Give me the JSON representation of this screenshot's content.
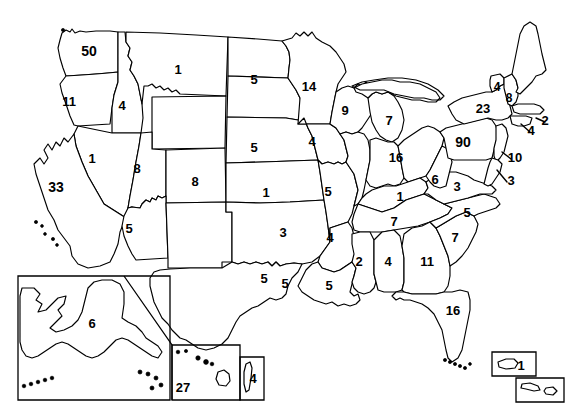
{
  "map": {
    "title": "United States electoral / count map",
    "background_color": "#ffffff",
    "outline_color": "#000000",
    "label_color": "#000000"
  },
  "chart_data": {
    "type": "map",
    "value_label": "count",
    "regions": [
      {
        "code": "WA",
        "name": "Washington",
        "value": "50",
        "x": 89,
        "y": 51,
        "size": "lg"
      },
      {
        "code": "OR",
        "name": "Oregon",
        "value": "11",
        "x": 69,
        "y": 101,
        "size": "md"
      },
      {
        "code": "ID",
        "name": "Idaho",
        "value": "4",
        "x": 122,
        "y": 105,
        "size": "md"
      },
      {
        "code": "MT",
        "name": "Montana",
        "value": "1",
        "x": 178,
        "y": 69,
        "size": "md"
      },
      {
        "code": "ND",
        "name": "North Dakota",
        "value": "5",
        "x": 254,
        "y": 79,
        "size": "md"
      },
      {
        "code": "SD",
        "name": "South Dakota",
        "value": "5",
        "x": 254,
        "y": 147,
        "size": "md"
      },
      {
        "code": "WY",
        "name": "Wyoming",
        "value": "",
        "x": 188,
        "y": 128,
        "size": "md"
      },
      {
        "code": "NV",
        "name": "Nevada",
        "value": "1",
        "x": 92,
        "y": 158,
        "size": "md"
      },
      {
        "code": "UT",
        "name": "Utah",
        "value": "8",
        "x": 137,
        "y": 168,
        "size": "md"
      },
      {
        "code": "CO",
        "name": "Colorado",
        "value": "8",
        "x": 195,
        "y": 181,
        "size": "md"
      },
      {
        "code": "CA",
        "name": "California",
        "value": "33",
        "x": 56,
        "y": 187,
        "size": "lg"
      },
      {
        "code": "AZ",
        "name": "Arizona",
        "value": "5",
        "x": 129,
        "y": 228,
        "size": "md"
      },
      {
        "code": "NM",
        "name": "New Mexico",
        "value": "",
        "x": 190,
        "y": 236,
        "size": "md"
      },
      {
        "code": "NE",
        "name": "Nebraska",
        "value": "1",
        "x": 266,
        "y": 192,
        "size": "md"
      },
      {
        "code": "KS",
        "name": "Kansas",
        "value": "3",
        "x": 283,
        "y": 232,
        "size": "md"
      },
      {
        "code": "OK",
        "name": "Oklahoma",
        "value": "5",
        "x": 285,
        "y": 283,
        "size": "md"
      },
      {
        "code": "TX",
        "name": "Texas",
        "value": "5",
        "x": 264,
        "y": 278,
        "size": "md"
      },
      {
        "code": "MN",
        "name": "Minnesota",
        "value": "14",
        "x": 309,
        "y": 86,
        "size": "md"
      },
      {
        "code": "IA",
        "name": "Iowa",
        "value": "4",
        "x": 312,
        "y": 141,
        "size": "md"
      },
      {
        "code": "MO",
        "name": "Missouri",
        "value": "5",
        "x": 328,
        "y": 191,
        "size": "md"
      },
      {
        "code": "AR",
        "name": "Arkansas",
        "value": "4",
        "x": 330,
        "y": 237,
        "size": "md"
      },
      {
        "code": "LA",
        "name": "Louisiana",
        "value": "5",
        "x": 329,
        "y": 285,
        "size": "md"
      },
      {
        "code": "WI",
        "name": "Wisconsin",
        "value": "9",
        "x": 345,
        "y": 110,
        "size": "md"
      },
      {
        "code": "MI",
        "name": "Michigan",
        "value": "7",
        "x": 389,
        "y": 120,
        "size": "md"
      },
      {
        "code": "IL",
        "name": "Illinois",
        "value": "",
        "x": 358,
        "y": 170,
        "size": "md"
      },
      {
        "code": "IN",
        "name": "Indiana",
        "value": "16",
        "x": 396,
        "y": 157,
        "size": "md"
      },
      {
        "code": "OH",
        "name": "Ohio",
        "value": "",
        "x": 425,
        "y": 148,
        "size": "md"
      },
      {
        "code": "KY",
        "name": "Kentucky",
        "value": "1",
        "x": 400,
        "y": 196,
        "size": "md"
      },
      {
        "code": "TN",
        "name": "Tennessee",
        "value": "7",
        "x": 394,
        "y": 221,
        "size": "md"
      },
      {
        "code": "MS",
        "name": "Mississippi",
        "value": "2",
        "x": 359,
        "y": 261,
        "size": "md"
      },
      {
        "code": "AL",
        "name": "Alabama",
        "value": "4",
        "x": 388,
        "y": 261,
        "size": "md"
      },
      {
        "code": "GA",
        "name": "Georgia",
        "value": "11",
        "x": 427,
        "y": 261,
        "size": "md"
      },
      {
        "code": "FL",
        "name": "Florida",
        "value": "16",
        "x": 453,
        "y": 310,
        "size": "md"
      },
      {
        "code": "SC",
        "name": "South Carolina",
        "value": "7",
        "x": 455,
        "y": 237,
        "size": "md"
      },
      {
        "code": "NC",
        "name": "North Carolina",
        "value": "5",
        "x": 467,
        "y": 212,
        "size": "md"
      },
      {
        "code": "VA",
        "name": "Virginia",
        "value": "3",
        "x": 457,
        "y": 186,
        "size": "md"
      },
      {
        "code": "WV",
        "name": "West Virginia",
        "value": "6",
        "x": 435,
        "y": 179,
        "size": "md"
      },
      {
        "code": "PA",
        "name": "Pennsylvania",
        "value": "90",
        "x": 463,
        "y": 142,
        "size": "lg"
      },
      {
        "code": "NY",
        "name": "New York",
        "value": "23",
        "x": 483,
        "y": 108,
        "size": "md"
      },
      {
        "code": "VT",
        "name": "Vermont",
        "value": "4",
        "x": 497,
        "y": 87,
        "size": "sm"
      },
      {
        "code": "NH",
        "name": "New Hampshire",
        "value": "8",
        "x": 509,
        "y": 98,
        "size": "sm"
      },
      {
        "code": "ME",
        "name": "Maine",
        "value": "",
        "x": 527,
        "y": 55,
        "size": "md"
      },
      {
        "code": "MA",
        "name": "Massachusetts",
        "value": "2",
        "x": 545,
        "y": 120,
        "size": "md"
      },
      {
        "code": "CT-RI",
        "name": "Connecticut and Rhode Island",
        "value": "4",
        "x": 531,
        "y": 130,
        "size": "md"
      },
      {
        "code": "NJ",
        "name": "New Jersey",
        "value": "10",
        "x": 515,
        "y": 157,
        "size": "md"
      },
      {
        "code": "DE-MD",
        "name": "Delaware and Maryland",
        "value": "3",
        "x": 511,
        "y": 180,
        "size": "md"
      },
      {
        "code": "AK",
        "name": "Alaska",
        "value": "6",
        "x": 92,
        "y": 323,
        "size": "md"
      },
      {
        "code": "HI",
        "name": "Hawaii",
        "value": "27",
        "x": 183,
        "y": 387,
        "size": "md"
      },
      {
        "code": "HI-SUB",
        "name": "Hawaii sub inset",
        "value": "4",
        "x": 253,
        "y": 378,
        "size": "md"
      },
      {
        "code": "PR",
        "name": "Puerto Rico",
        "value": "1",
        "x": 521,
        "y": 365,
        "size": "md"
      },
      {
        "code": "VI",
        "name": "Virgin Islands",
        "value": "",
        "x": 540,
        "y": 390,
        "size": "md"
      }
    ]
  },
  "insets": [
    {
      "name": "alaska-inset",
      "label": "Alaska"
    },
    {
      "name": "hawaii-inset",
      "label": "Hawaii"
    },
    {
      "name": "hawaii-sub-inset",
      "label": "Hawaii sub"
    },
    {
      "name": "puerto-rico-inset",
      "label": "Puerto Rico"
    },
    {
      "name": "virgin-islands-inset",
      "label": "Virgin Islands"
    }
  ]
}
